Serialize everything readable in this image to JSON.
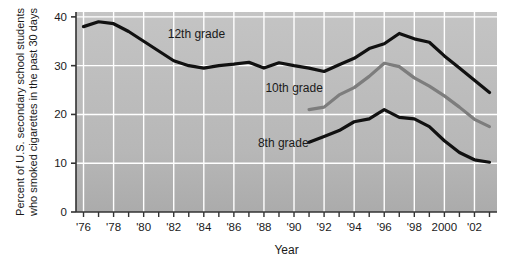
{
  "chart_data": {
    "type": "line",
    "title": "",
    "xlabel": "Year",
    "ylabel": "Percent of U.S. secondary school students who smoked cigarettes in the past 30 days",
    "ylabel_line1": "Percent of U.S. secondary school students",
    "ylabel_line2": "who smoked cigarettes in the past 30 days",
    "xlim": [
      1975.5,
      2003.5
    ],
    "ylim": [
      0,
      41
    ],
    "yticks": [
      0,
      10,
      20,
      30,
      40
    ],
    "ytick_labels": [
      "0",
      "10",
      "20",
      "30",
      "40"
    ],
    "xticks": [
      1976,
      1977,
      1978,
      1979,
      1980,
      1981,
      1982,
      1983,
      1984,
      1985,
      1986,
      1987,
      1988,
      1989,
      1990,
      1991,
      1992,
      1993,
      1994,
      1995,
      1996,
      1997,
      1998,
      1999,
      2000,
      2001,
      2002,
      2003
    ],
    "xtick_labels_major": [
      {
        "x": 1976,
        "label": "'76"
      },
      {
        "x": 1978,
        "label": "'78"
      },
      {
        "x": 1980,
        "label": "'80"
      },
      {
        "x": 1982,
        "label": "'82"
      },
      {
        "x": 1984,
        "label": "'84"
      },
      {
        "x": 1986,
        "label": "'86"
      },
      {
        "x": 1988,
        "label": "'88"
      },
      {
        "x": 1990,
        "label": "'90"
      },
      {
        "x": 1992,
        "label": "'92"
      },
      {
        "x": 1994,
        "label": "'94"
      },
      {
        "x": 1996,
        "label": "'96"
      },
      {
        "x": 1998,
        "label": "'98"
      },
      {
        "x": 2000,
        "label": "2000"
      },
      {
        "x": 2002,
        "label": "'02"
      }
    ],
    "grid": {
      "vertical": true,
      "horizontal": true,
      "color": "#ffffff"
    },
    "plot_background": "#b9b9b9",
    "legend": "inline-labels",
    "series": [
      {
        "name": "12th grade",
        "label": "12th grade",
        "color": "#111111",
        "width": 3.2,
        "label_x": 1981.6,
        "label_y": 35.6,
        "x": [
          1976,
          1977,
          1978,
          1979,
          1980,
          1981,
          1982,
          1983,
          1984,
          1985,
          1986,
          1987,
          1988,
          1989,
          1990,
          1991,
          1992,
          1993,
          1994,
          1995,
          1996,
          1997,
          1998,
          1999,
          2000,
          2001,
          2002,
          2003
        ],
        "values": [
          38.0,
          39.0,
          38.6,
          37.0,
          35.0,
          33.0,
          31.0,
          30.0,
          29.5,
          30.0,
          30.3,
          30.7,
          29.5,
          30.6,
          30.0,
          29.5,
          28.8,
          30.2,
          31.5,
          33.5,
          34.5,
          36.6,
          35.5,
          34.8,
          32.0,
          29.5,
          27.0,
          24.5
        ]
      },
      {
        "name": "10th grade",
        "label": "10th grade",
        "color": "#7d7d7d",
        "width": 3.2,
        "label_x": 1988.1,
        "label_y": 24.5,
        "x": [
          1991,
          1992,
          1993,
          1994,
          1995,
          1996,
          1997,
          1998,
          1999,
          2000,
          2001,
          2002,
          2003
        ],
        "values": [
          21.0,
          21.5,
          24.0,
          25.5,
          27.8,
          30.5,
          29.8,
          27.5,
          25.8,
          23.8,
          21.5,
          19.0,
          17.5
        ]
      },
      {
        "name": "8th grade",
        "label": "8th grade",
        "color": "#111111",
        "width": 3.2,
        "label_x": 1987.6,
        "label_y": 13.4,
        "x": [
          1991,
          1992,
          1993,
          1994,
          1995,
          1996,
          1997,
          1998,
          1999,
          2000,
          2001,
          2002,
          2003
        ],
        "values": [
          14.3,
          15.5,
          16.7,
          18.5,
          19.1,
          21.0,
          19.4,
          19.1,
          17.5,
          14.6,
          12.2,
          10.7,
          10.2
        ]
      }
    ]
  }
}
